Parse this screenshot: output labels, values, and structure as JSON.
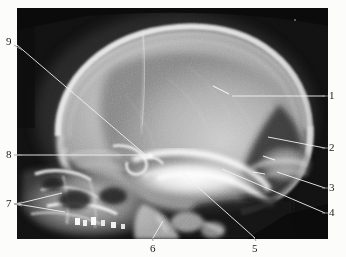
{
  "figure": {
    "type": "radiograph",
    "modality": "X-ray",
    "view": "lateral skull",
    "background_color": "#fcfcfb",
    "plate": {
      "x": 17,
      "y": 8,
      "width": 311,
      "height": 231,
      "film_color": "#0b0b0b"
    },
    "label_color": "#1a1a1a",
    "leader_color": "#f2f2f2"
  },
  "labels": [
    {
      "id": "1",
      "text": "1",
      "x": 327,
      "y": 91,
      "side": "right",
      "leader": {
        "x1": 325,
        "y1": 96,
        "x2": 232,
        "y2": 96
      }
    },
    {
      "id": "2",
      "text": "2",
      "x": 327,
      "y": 143,
      "side": "right",
      "leader": {
        "x1": 325,
        "y1": 148,
        "x2": 268,
        "y2": 137
      }
    },
    {
      "id": "3",
      "text": "3",
      "x": 327,
      "y": 183,
      "side": "right",
      "leader": {
        "x1": 325,
        "y1": 188,
        "x2": 277,
        "y2": 172
      }
    },
    {
      "id": "4",
      "text": "4",
      "x": 327,
      "y": 208,
      "side": "right",
      "leader": {
        "x1": 325,
        "y1": 213,
        "x2": 222,
        "y2": 169
      }
    },
    {
      "id": "5",
      "text": "5",
      "x": 252,
      "y": 241,
      "side": "bottom",
      "leader": {
        "x1": 255,
        "y1": 239,
        "x2": 182,
        "y2": 173
      }
    },
    {
      "id": "6",
      "text": "6",
      "x": 150,
      "y": 241,
      "side": "bottom",
      "leader": {
        "x1": 153,
        "y1": 239,
        "x2": 163,
        "y2": 222
      }
    },
    {
      "id": "7",
      "text": "7",
      "x": 8,
      "y": 199,
      "side": "left",
      "leader": {
        "x1": 16,
        "y1": 204,
        "x2": 62,
        "y2": 193
      },
      "leader2": {
        "x1": 16,
        "y1": 204,
        "x2": 64,
        "y2": 212
      }
    },
    {
      "id": "8",
      "text": "8",
      "x": 8,
      "y": 150,
      "side": "left",
      "leader": {
        "x1": 16,
        "y1": 155,
        "x2": 148,
        "y2": 155
      }
    },
    {
      "id": "9",
      "text": "9",
      "x": 8,
      "y": 37,
      "side": "left",
      "leader": {
        "x1": 16,
        "y1": 45,
        "x2": 148,
        "y2": 157
      }
    }
  ],
  "anatomy_notes": {
    "cranial_vault": "large rounded skull vault occupying upper portion",
    "sutures": "faint vertical lucent suture line in parietal region",
    "occiput": "dense bright occipital bone, lower right",
    "skull_base": "bright sella / skull base structures at center",
    "face_cervical": "facial bones and cervical spine at lower left"
  }
}
